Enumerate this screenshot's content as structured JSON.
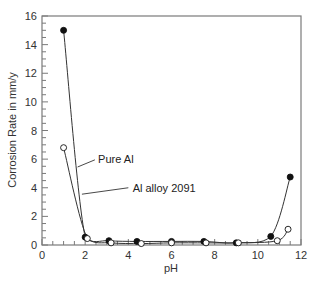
{
  "chart_data": {
    "type": "line",
    "title": "",
    "xlabel": "pH",
    "ylabel": "Corrosion Rate in mm/y",
    "xlim": [
      0,
      12
    ],
    "ylim": [
      0,
      16
    ],
    "x_ticks": [
      0,
      2,
      4,
      6,
      8,
      10,
      12
    ],
    "y_ticks": [
      0,
      2,
      4,
      6,
      8,
      10,
      12,
      14,
      16
    ],
    "x_minor_step": 0.5,
    "y_minor_step": 0.5,
    "grid": false,
    "legend": "inline annotations",
    "series": [
      {
        "name": "Al alloy 2091",
        "marker": "filled-circle",
        "x": [
          1.0,
          2.0,
          3.1,
          4.4,
          6.0,
          7.5,
          9.0,
          10.6,
          11.5
        ],
        "y": [
          15.0,
          0.55,
          0.3,
          0.25,
          0.25,
          0.25,
          0.15,
          0.6,
          4.75
        ]
      },
      {
        "name": "Pure Al",
        "marker": "open-circle",
        "x": [
          1.0,
          2.1,
          3.2,
          4.6,
          6.0,
          7.6,
          9.1,
          10.9,
          11.4
        ],
        "y": [
          6.8,
          0.45,
          0.15,
          0.1,
          0.15,
          0.15,
          0.15,
          0.3,
          1.1
        ]
      }
    ],
    "annotations": [
      {
        "text": "Pure Al",
        "x": 2.6,
        "y": 6.0
      },
      {
        "text": "Al alloy 2091",
        "x": 4.2,
        "y": 4.0
      }
    ]
  },
  "colors": {
    "axis": "#7a7a7a",
    "line": "#333333",
    "marker_fill": "#111111",
    "open_marker_fill": "#ffffff"
  }
}
